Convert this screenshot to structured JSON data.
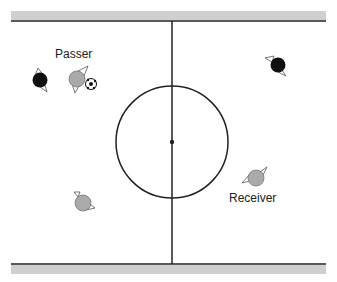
{
  "labels": {
    "passer": "Passer",
    "receiver": "Receiver"
  },
  "colors": {
    "band": "#cfcfcf",
    "line": "#222222",
    "teammate": "#aaaaaa",
    "opponent": "#111111"
  },
  "players": [
    {
      "role": "opponent",
      "x": 40,
      "y": 80
    },
    {
      "role": "passer",
      "x": 77,
      "y": 79
    },
    {
      "role": "opponent",
      "x": 278,
      "y": 65
    },
    {
      "role": "receiver",
      "x": 256,
      "y": 178
    },
    {
      "role": "teammate",
      "x": 83,
      "y": 203
    }
  ],
  "ball": {
    "x": 91,
    "y": 84
  }
}
